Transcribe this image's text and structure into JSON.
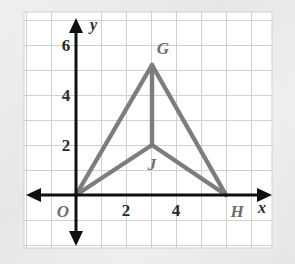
{
  "figure": {
    "type": "coordinate-plane-geometry-diagram",
    "background_color": "#efefef",
    "plot_background": "#ffffff",
    "grid_color": "#cfcfcf",
    "axis_color": "#000000",
    "shape_color": "#7d7d7d",
    "plot_area": {
      "left": 24,
      "top": 12,
      "right": 272,
      "bottom": 248
    },
    "grid": {
      "spacing_px": 25,
      "origin_px": {
        "x": 76,
        "y": 195
      },
      "vertical_lines_x": [
        26,
        51,
        76,
        101,
        126,
        151,
        176,
        201,
        226,
        251
      ],
      "horizontal_lines_y": [
        20,
        45,
        70,
        95,
        120,
        145,
        170,
        195,
        220,
        245
      ]
    },
    "axes": {
      "x_axis": {
        "label": "x",
        "label_px": {
          "x": 262,
          "y": 212
        },
        "ticks": [
          {
            "value": "2",
            "px_x": 126,
            "px_y": 214
          },
          {
            "value": "4",
            "px_x": 176,
            "px_y": 214
          }
        ]
      },
      "y_axis": {
        "label": "y",
        "label_px": {
          "x": 90,
          "y": 30
        },
        "ticks": [
          {
            "value": "2",
            "px_x": 62,
            "px_y": 151
          },
          {
            "value": "4",
            "px_x": 62,
            "px_y": 101
          },
          {
            "value": "6",
            "px_x": 62,
            "px_y": 51
          }
        ]
      }
    },
    "points": [
      {
        "name": "O",
        "coords": [
          0,
          0
        ],
        "px": {
          "x": 76,
          "y": 195
        },
        "label_px": {
          "x": 63,
          "y": 216
        }
      },
      {
        "name": "G",
        "coords": [
          3,
          5.2
        ],
        "px": {
          "x": 152,
          "y": 65
        },
        "label_px": {
          "x": 160,
          "y": 52
        }
      },
      {
        "name": "J",
        "coords": [
          3,
          2
        ],
        "px": {
          "x": 152,
          "y": 145
        },
        "label_px": {
          "x": 150,
          "y": 168
        }
      },
      {
        "name": "H",
        "coords": [
          6,
          0
        ],
        "px": {
          "x": 226,
          "y": 195
        },
        "label_px": {
          "x": 233,
          "y": 216
        }
      }
    ],
    "segments": [
      {
        "name": "OG",
        "from": "O",
        "to": "G"
      },
      {
        "name": "GH",
        "from": "G",
        "to": "H"
      },
      {
        "name": "OJ",
        "from": "O",
        "to": "J"
      },
      {
        "name": "JH",
        "from": "J",
        "to": "H"
      },
      {
        "name": "GJ",
        "from": "G",
        "to": "J"
      }
    ]
  }
}
